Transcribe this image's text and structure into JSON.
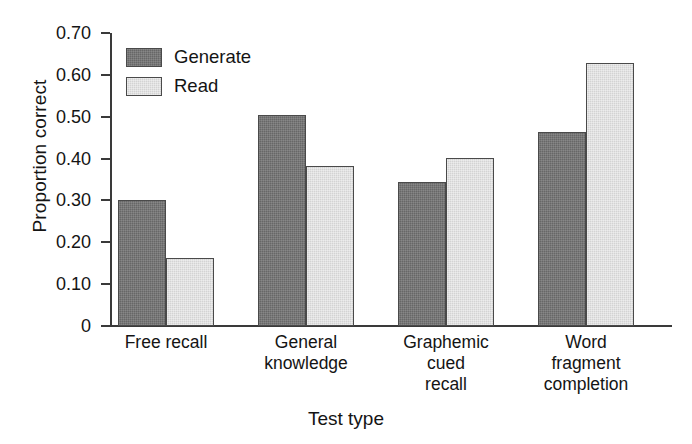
{
  "chart_data": {
    "type": "bar",
    "title": "",
    "xlabel": "Test type",
    "ylabel": "Proportion correct",
    "categories": [
      "Free recall",
      "General knowledge",
      "Graphemic cued recall",
      "Word fragment completion"
    ],
    "category_lines": [
      [
        "Free recall"
      ],
      [
        "General",
        "knowledge"
      ],
      [
        "Graphemic",
        "cued",
        "recall"
      ],
      [
        "Word",
        "fragment",
        "completion"
      ]
    ],
    "series": [
      {
        "name": "Generate",
        "color": "#676767",
        "values": [
          0.3,
          0.505,
          0.343,
          0.464
        ]
      },
      {
        "name": "Read",
        "color": "#d3d3d3",
        "values": [
          0.162,
          0.382,
          0.402,
          0.628
        ]
      }
    ],
    "ylim": [
      0,
      0.7
    ],
    "ytick_values": [
      0,
      0.1,
      0.2,
      0.3,
      0.4,
      0.5,
      0.6,
      0.7
    ],
    "ytick_labels": [
      "0",
      "0.10",
      "0.20",
      "0.30",
      "0.40",
      "0.50",
      "0.60",
      "0.70"
    ],
    "grid": false,
    "legend_position": "upper-left-inside",
    "legend_entries": [
      "Generate",
      "Read"
    ]
  }
}
